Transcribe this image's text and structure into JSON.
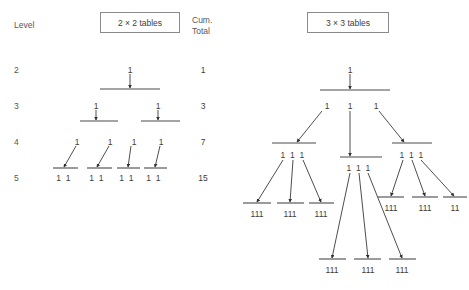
{
  "figure": {
    "background_color": "#ffffff",
    "line_color": "#4a4a4a",
    "text_color": "#3d3d3d",
    "headers": {
      "level_label": "Level",
      "left_box": "2 × 2 tables",
      "cum_total_line1": "Cum.",
      "cum_total_line2": "Total",
      "right_box": "3 × 3 tables"
    },
    "levels": [
      {
        "label": "2",
        "y": 70,
        "cum_total": "1"
      },
      {
        "label": "3",
        "y": 106,
        "cum_total": "3"
      },
      {
        "label": "4",
        "y": 142,
        "cum_total": "7"
      },
      {
        "label": "5",
        "y": 178,
        "cum_total": "15"
      }
    ]
  },
  "left_tree": {
    "title": "2 × 2 tables",
    "nodes": [
      {
        "id": "L2-a",
        "text": "1",
        "x": 130,
        "y": 70,
        "level": 2
      },
      {
        "id": "L3-a",
        "text": "1",
        "x": 96,
        "y": 106,
        "level": 3
      },
      {
        "id": "L3-b",
        "text": "1",
        "x": 158,
        "y": 106,
        "level": 3
      },
      {
        "id": "L4-a",
        "text": "1",
        "x": 77,
        "y": 142,
        "level": 4
      },
      {
        "id": "L4-b",
        "text": "1",
        "x": 110,
        "y": 142,
        "level": 4
      },
      {
        "id": "L4-c",
        "text": "1",
        "x": 134,
        "y": 142,
        "level": 4
      },
      {
        "id": "L4-d",
        "text": "1",
        "x": 161,
        "y": 142,
        "level": 4
      },
      {
        "id": "L5-a",
        "text": "1 1",
        "x": 64,
        "y": 178,
        "level": 5
      },
      {
        "id": "L5-b",
        "text": "1 1",
        "x": 97,
        "y": 178,
        "level": 5
      },
      {
        "id": "L5-c",
        "text": "1 1",
        "x": 127,
        "y": 178,
        "level": 5
      },
      {
        "id": "L5-d",
        "text": "1 1",
        "x": 154,
        "y": 178,
        "level": 5
      }
    ],
    "bars": [
      {
        "id": "bar-L2",
        "x1": 100,
        "x2": 160,
        "y": 89
      },
      {
        "id": "bar-L3-a",
        "x1": 80,
        "x2": 118,
        "y": 121
      },
      {
        "id": "bar-L3-b",
        "x1": 141,
        "x2": 180,
        "y": 121
      },
      {
        "id": "bar-L4-a",
        "x1": 53,
        "x2": 78,
        "y": 168
      },
      {
        "id": "bar-L4-b",
        "x1": 87,
        "x2": 112,
        "y": 168
      },
      {
        "id": "bar-L4-c",
        "x1": 117,
        "x2": 140,
        "y": 168
      },
      {
        "id": "bar-L4-d",
        "x1": 144,
        "x2": 167,
        "y": 168
      }
    ],
    "arrows": [
      {
        "id": "arr-L2-to-L3",
        "x1": 130,
        "y1": 74,
        "x2": 130,
        "y2": 88
      },
      {
        "id": "arr-L3a",
        "x1": 96,
        "y1": 110,
        "x2": 96,
        "y2": 120
      },
      {
        "id": "arr-L3b",
        "x1": 158,
        "y1": 110,
        "x2": 158,
        "y2": 120
      },
      {
        "id": "arr-L4a",
        "x1": 76,
        "y1": 146,
        "x2": 64,
        "y2": 167
      },
      {
        "id": "arr-L4b",
        "x1": 109,
        "y1": 146,
        "x2": 97,
        "y2": 167
      },
      {
        "id": "arr-L4c",
        "x1": 131,
        "y1": 146,
        "x2": 128,
        "y2": 167
      },
      {
        "id": "arr-L4d",
        "x1": 160,
        "y1": 146,
        "x2": 155,
        "y2": 167
      }
    ]
  },
  "right_tree": {
    "title": "3 × 3 tables",
    "nodes": [
      {
        "id": "R-root",
        "text": "1",
        "x": 350,
        "y": 70
      },
      {
        "id": "R-l3-a",
        "text": "1",
        "x": 327,
        "y": 106
      },
      {
        "id": "R-l3-b",
        "text": "1",
        "x": 350,
        "y": 106
      },
      {
        "id": "R-l3-c",
        "text": "1",
        "x": 376,
        "y": 106
      },
      {
        "id": "R-l4-a",
        "text": "1 1 1",
        "x": 293,
        "y": 155
      },
      {
        "id": "R-l4-b",
        "text": "1 1 1",
        "x": 359,
        "y": 168
      },
      {
        "id": "R-l4-c",
        "text": "1 1 1",
        "x": 412,
        "y": 155
      },
      {
        "id": "R-l5-a",
        "text": "111",
        "x": 257,
        "y": 214
      },
      {
        "id": "R-l5-b",
        "text": "111",
        "x": 290,
        "y": 214
      },
      {
        "id": "R-l5-c",
        "text": "111",
        "x": 321,
        "y": 214
      },
      {
        "id": "R-l5-d",
        "text": "111",
        "x": 391,
        "y": 208
      },
      {
        "id": "R-l5-e",
        "text": "111",
        "x": 425,
        "y": 208
      },
      {
        "id": "R-l5-f",
        "text": "11",
        "x": 455,
        "y": 208
      },
      {
        "id": "R-l6-a",
        "text": "111",
        "x": 332,
        "y": 270
      },
      {
        "id": "R-l6-b",
        "text": "111",
        "x": 368,
        "y": 270
      },
      {
        "id": "R-l6-c",
        "text": "111",
        "x": 402,
        "y": 270
      }
    ],
    "bars": [
      {
        "id": "rbar-root",
        "x1": 320,
        "x2": 390,
        "y": 90
      },
      {
        "id": "rbar-l4a",
        "x1": 272,
        "x2": 316,
        "y": 143
      },
      {
        "id": "rbar-l4b",
        "x1": 340,
        "x2": 382,
        "y": 157
      },
      {
        "id": "rbar-l4c",
        "x1": 392,
        "x2": 432,
        "y": 143
      },
      {
        "id": "rbar-l5a",
        "x1": 243,
        "x2": 271,
        "y": 203
      },
      {
        "id": "rbar-l5b",
        "x1": 277,
        "x2": 304,
        "y": 203
      },
      {
        "id": "rbar-l5c",
        "x1": 309,
        "x2": 334,
        "y": 203
      },
      {
        "id": "rbar-l5d",
        "x1": 378,
        "x2": 404,
        "y": 197
      },
      {
        "id": "rbar-l5e",
        "x1": 412,
        "x2": 438,
        "y": 197
      },
      {
        "id": "rbar-l5f",
        "x1": 443,
        "x2": 467,
        "y": 197
      },
      {
        "id": "rbar-l6a",
        "x1": 319,
        "x2": 346,
        "y": 259
      },
      {
        "id": "rbar-l6b",
        "x1": 354,
        "x2": 381,
        "y": 259
      },
      {
        "id": "rbar-l6c",
        "x1": 389,
        "x2": 416,
        "y": 259
      }
    ],
    "arrows": [
      {
        "id": "rarr-root",
        "x1": 350,
        "y1": 74,
        "x2": 350,
        "y2": 89
      },
      {
        "id": "rarr-l3a",
        "x1": 322,
        "y1": 111,
        "x2": 297,
        "y2": 142
      },
      {
        "id": "rarr-l3b",
        "x1": 350,
        "y1": 111,
        "x2": 350,
        "y2": 156
      },
      {
        "id": "rarr-l3c",
        "x1": 379,
        "y1": 111,
        "x2": 404,
        "y2": 142
      },
      {
        "id": "rarr-l4a1",
        "x1": 283,
        "y1": 160,
        "x2": 257,
        "y2": 202
      },
      {
        "id": "rarr-l4a2",
        "x1": 293,
        "y1": 160,
        "x2": 290,
        "y2": 202
      },
      {
        "id": "rarr-l4a3",
        "x1": 303,
        "y1": 160,
        "x2": 321,
        "y2": 202
      },
      {
        "id": "rarr-l4b1",
        "x1": 350,
        "y1": 173,
        "x2": 332,
        "y2": 258
      },
      {
        "id": "rarr-l4b2",
        "x1": 359,
        "y1": 173,
        "x2": 368,
        "y2": 258
      },
      {
        "id": "rarr-l4b3",
        "x1": 368,
        "y1": 173,
        "x2": 402,
        "y2": 258
      },
      {
        "id": "rarr-l4c1",
        "x1": 403,
        "y1": 160,
        "x2": 391,
        "y2": 196
      },
      {
        "id": "rarr-l4c2",
        "x1": 412,
        "y1": 160,
        "x2": 425,
        "y2": 196
      },
      {
        "id": "rarr-l4c3",
        "x1": 421,
        "y1": 160,
        "x2": 454,
        "y2": 196
      }
    ]
  }
}
